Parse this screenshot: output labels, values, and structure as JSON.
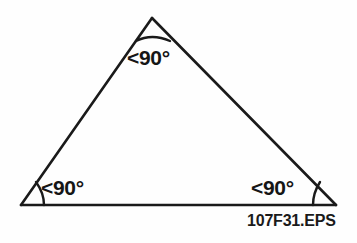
{
  "figure": {
    "caption": "107F31.EPS",
    "stroke_color": "#1a1a1a",
    "background_color": "#fefefe",
    "labels": {
      "apex": "<90°",
      "bottom_left": "<90°",
      "bottom_right": "<90°"
    },
    "vertices": {
      "apex": {
        "x": 152,
        "y": 18
      },
      "bottom_left": {
        "x": 21,
        "y": 205
      },
      "bottom_right": {
        "x": 336,
        "y": 205
      }
    },
    "arcs": {
      "apex": "angle-arc-apex",
      "bottom_left": "angle-arc-bottom-left",
      "bottom_right": "angle-arc-bottom-right"
    }
  }
}
